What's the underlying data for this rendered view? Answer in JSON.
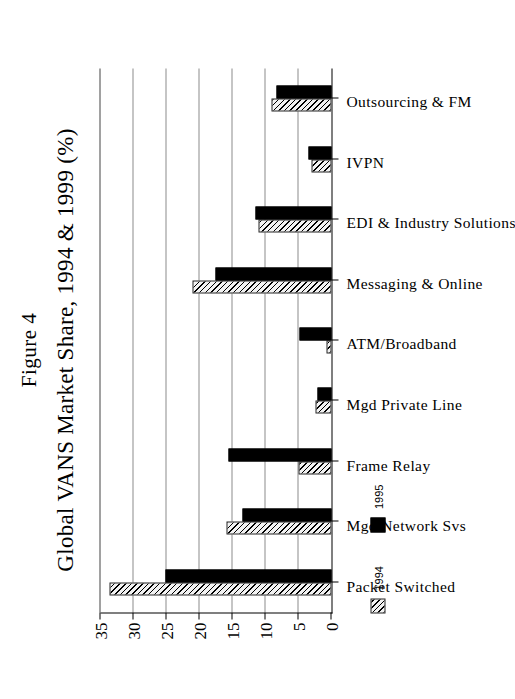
{
  "figure": {
    "label": "Figure 4",
    "title": "Global VANS Market Share, 1994 & 1999 (%)"
  },
  "chart_data": {
    "type": "bar",
    "title": "Global VANS Market Share, 1994 & 1999 (%)",
    "xlabel": "",
    "ylabel": "",
    "ylim": [
      0,
      35
    ],
    "yticks": [
      0,
      5,
      10,
      15,
      20,
      25,
      30,
      35
    ],
    "grid": true,
    "legend_position": "bottom-left",
    "orientation": "vertical-bars-page-rotated-90cw",
    "categories": [
      "Packet Switched",
      "Mgd Network Svs",
      "Frame Relay",
      "Mgd Private Line",
      "ATM/Broadband",
      "Messaging & Online",
      "EDI & Industry Solutions",
      "IVPN",
      "Outsourcing & FM"
    ],
    "series": [
      {
        "name": "1994",
        "style": "hatched",
        "values": [
          33.5,
          15.8,
          5.0,
          2.4,
          0.8,
          21.0,
          11.0,
          3.0,
          9.0
        ]
      },
      {
        "name": "1995",
        "style": "solid-black",
        "values": [
          25.0,
          13.5,
          15.5,
          2.1,
          4.8,
          17.5,
          11.5,
          3.5,
          8.3
        ]
      }
    ]
  },
  "legend": {
    "items": [
      {
        "label": "1994"
      },
      {
        "label": "1995"
      }
    ]
  }
}
